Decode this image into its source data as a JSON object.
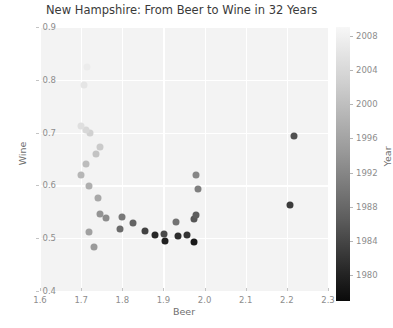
{
  "chart_data": {
    "type": "scatter",
    "title": "New Hampshire: From Beer to Wine in 32 Years",
    "xlabel": "Beer",
    "ylabel": "Wine",
    "xlim": [
      1.6,
      2.3
    ],
    "ylim": [
      0.4,
      0.9
    ],
    "xticks": [
      "1.6",
      "1.7",
      "1.8",
      "1.9",
      "2.0",
      "2.1",
      "2.2",
      "2.3"
    ],
    "yticks": [
      "0.4",
      "0.5",
      "0.6",
      "0.7",
      "0.8",
      "0.9"
    ],
    "grid": true,
    "colorbar": {
      "label": "Year",
      "position": "right",
      "colormap": "gray_reversed",
      "vmin": 1977,
      "vmax": 2009,
      "ticks": [
        "1980",
        "1984",
        "1988",
        "1992",
        "1996",
        "2000",
        "2004",
        "2008"
      ],
      "tick_values": [
        1980,
        1984,
        1988,
        1992,
        1996,
        2000,
        2004,
        2008
      ]
    },
    "series_name": "New Hampshire per-capita consumption",
    "point_encoding": "color = Year (dark = earliest, light = latest)",
    "points": [
      {
        "beer": 1.975,
        "wine": 0.492,
        "year": 1977
      },
      {
        "beer": 1.905,
        "wine": 0.494,
        "year": 1978
      },
      {
        "beer": 1.88,
        "wine": 0.506,
        "year": 1979
      },
      {
        "beer": 1.935,
        "wine": 0.505,
        "year": 1980
      },
      {
        "beer": 1.958,
        "wine": 0.506,
        "year": 1981
      },
      {
        "beer": 2.208,
        "wine": 0.563,
        "year": 1982
      },
      {
        "beer": 1.855,
        "wine": 0.513,
        "year": 1983
      },
      {
        "beer": 1.902,
        "wine": 0.508,
        "year": 1984
      },
      {
        "beer": 2.218,
        "wine": 0.694,
        "year": 1985
      },
      {
        "beer": 1.975,
        "wine": 0.537,
        "year": 1986
      },
      {
        "beer": 1.978,
        "wine": 0.543,
        "year": 1987
      },
      {
        "beer": 1.825,
        "wine": 0.528,
        "year": 1988
      },
      {
        "beer": 1.795,
        "wine": 0.518,
        "year": 1989
      },
      {
        "beer": 1.93,
        "wine": 0.53,
        "year": 1990
      },
      {
        "beer": 1.8,
        "wine": 0.54,
        "year": 1991
      },
      {
        "beer": 1.985,
        "wine": 0.593,
        "year": 1992
      },
      {
        "beer": 1.978,
        "wine": 0.62,
        "year": 1993
      },
      {
        "beer": 1.76,
        "wine": 0.538,
        "year": 1994
      },
      {
        "beer": 1.745,
        "wine": 0.545,
        "year": 1995
      },
      {
        "beer": 1.732,
        "wine": 0.483,
        "year": 1996
      },
      {
        "beer": 1.718,
        "wine": 0.512,
        "year": 1997
      },
      {
        "beer": 1.742,
        "wine": 0.576,
        "year": 1998
      },
      {
        "beer": 1.718,
        "wine": 0.598,
        "year": 1999
      },
      {
        "beer": 1.7,
        "wine": 0.62,
        "year": 2000
      },
      {
        "beer": 1.712,
        "wine": 0.64,
        "year": 2001
      },
      {
        "beer": 1.735,
        "wine": 0.66,
        "year": 2002
      },
      {
        "beer": 1.745,
        "wine": 0.672,
        "year": 2003
      },
      {
        "beer": 1.722,
        "wine": 0.7,
        "year": 2004
      },
      {
        "beer": 1.712,
        "wine": 0.705,
        "year": 2005
      },
      {
        "beer": 1.7,
        "wine": 0.712,
        "year": 2006
      },
      {
        "beer": 1.708,
        "wine": 0.79,
        "year": 2007
      },
      {
        "beer": 1.715,
        "wine": 0.825,
        "year": 2008
      }
    ]
  }
}
